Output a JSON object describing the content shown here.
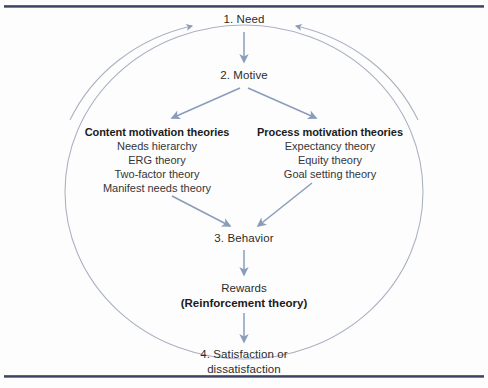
{
  "diagram": {
    "colors": {
      "arrow": "#8b9cbb",
      "circle": "#a9b0c2",
      "rule": "#3c4463",
      "text": "#2c2c2c",
      "background": "#fdfdfd"
    },
    "nodes": {
      "need": "1. Need",
      "motive": "2. Motive",
      "behavior": "3. Behavior",
      "rewards": "Rewards",
      "reinforcement": "(Reinforcement theory)",
      "satisfaction_line1": "4. Satisfaction or",
      "satisfaction_line2": "dissatisfaction"
    },
    "columns": [
      {
        "heading": "Content motivation theories",
        "items": [
          "Needs hierarchy",
          "ERG theory",
          "Two-factor theory",
          "Manifest needs theory"
        ]
      },
      {
        "heading": "Process motivation theories",
        "items": [
          "Expectancy theory",
          "Equity theory",
          "Goal setting theory"
        ]
      }
    ]
  }
}
